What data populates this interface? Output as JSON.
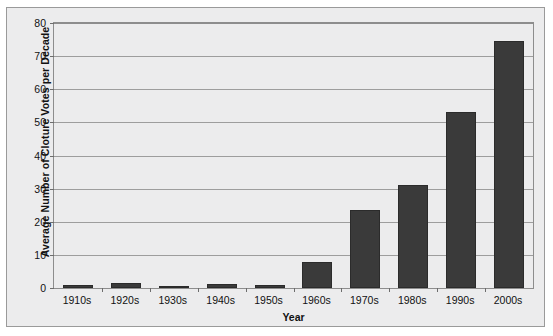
{
  "chart_data": {
    "type": "bar",
    "title": "",
    "xlabel": "Year",
    "ylabel": "Average Number of Cloture Votes per Decade",
    "categories": [
      "1910s",
      "1920s",
      "1930s",
      "1940s",
      "1950s",
      "1960s",
      "1970s",
      "1980s",
      "1990s",
      "2000s"
    ],
    "values": [
      1,
      1.6,
      0.5,
      1.2,
      1,
      8,
      23.5,
      31,
      53,
      74.5
    ],
    "ylim": [
      0,
      80
    ],
    "yticks": [
      0,
      10,
      20,
      30,
      40,
      50,
      60,
      70,
      80
    ],
    "ytick_labels": [
      "0",
      "10",
      "20",
      "30",
      "40",
      "50",
      "60",
      "70",
      "80"
    ],
    "grid": true,
    "legend": false,
    "bar_color": "#3a3a3a",
    "plot_background": "#ececed",
    "grid_color": "#9d9d9d",
    "axis_color": "#8d8d8d",
    "text_color": "#111111"
  }
}
